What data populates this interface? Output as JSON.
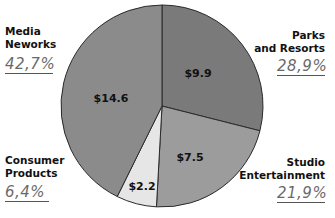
{
  "chart_data": {
    "type": "pie",
    "title": "",
    "units": "$ (billions implied)",
    "categories": [
      "Parks and Resorts",
      "Studio Entertainment",
      "Consumer Products",
      "Media Neworks"
    ],
    "values": [
      9.9,
      7.5,
      2.2,
      14.6
    ],
    "value_labels": [
      "$9.9",
      "$7.5",
      "$2.2",
      "$14.6"
    ],
    "percentages": [
      28.9,
      21.9,
      6.4,
      42.7
    ],
    "percentage_labels": [
      "28,9%",
      "21,9%",
      "6,4%",
      "42,7%"
    ],
    "colors": [
      "#7a7a7a",
      "#9c9c9c",
      "#e6e6e6",
      "#8b8b8b"
    ],
    "start_angle_deg": 0,
    "direction": "clockwise",
    "legend": "none (direct labels at corners)"
  },
  "labels": {
    "media": {
      "line1": "Media",
      "line2": "Neworks",
      "pct": "42,7%"
    },
    "parks": {
      "line1": "Parks",
      "line2": "and Resorts",
      "pct": "28,9%"
    },
    "consumer": {
      "line1": "Consumer",
      "line2": "Products",
      "pct": "6,4%"
    },
    "studio": {
      "line1": "Studio",
      "line2": "Entertainment",
      "pct": "21,9%"
    }
  },
  "slices": {
    "parks": {
      "value_label": "$9.9"
    },
    "studio": {
      "value_label": "$7.5"
    },
    "consumer": {
      "value_label": "$2.2"
    },
    "media": {
      "value_label": "$14.6"
    }
  }
}
